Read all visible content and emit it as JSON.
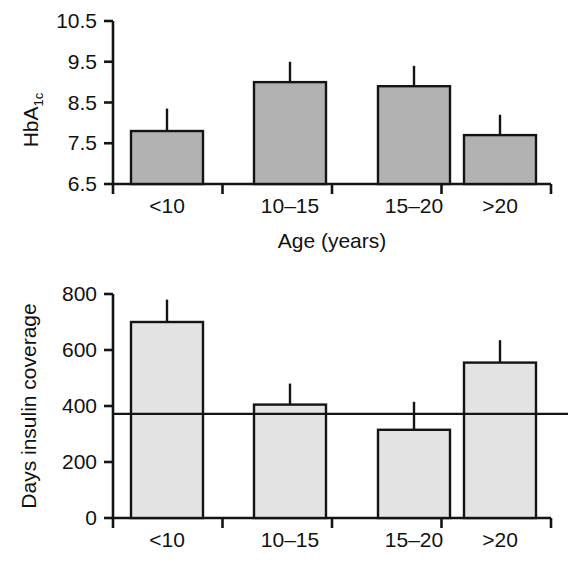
{
  "figure": {
    "name": "hba1c-and-insulin-coverage-by-age",
    "background_color": "#ffffff",
    "axis_color": "#141414"
  },
  "chart_data": [
    {
      "type": "bar",
      "name": "hba1c-by-age",
      "title": "",
      "xlabel": "Age (years)",
      "ylabel": "HbA1c",
      "ylabel_main": "HbA",
      "ylabel_sub": "1c",
      "categories": [
        "<10",
        "10–15",
        "15–20",
        ">20"
      ],
      "values": [
        7.8,
        9.0,
        8.9,
        7.7
      ],
      "errors_upper": [
        8.35,
        9.5,
        9.4,
        8.2
      ],
      "ytick_labels": [
        "6.5",
        "7.5",
        "8.5",
        "9.5",
        "10.5"
      ],
      "yticks": [
        6.5,
        7.5,
        8.5,
        9.5,
        10.5
      ],
      "ylim": [
        6.5,
        10.5
      ],
      "grid": false,
      "legend": "none",
      "bar_fill": "#b2b2b2",
      "bar_edge": "#141414"
    },
    {
      "type": "bar",
      "name": "days-insulin-coverage-by-age",
      "title": "",
      "xlabel": "",
      "ylabel": "Days insulin coverage",
      "categories": [
        "<10",
        "10–15",
        "15–20",
        ">20"
      ],
      "values": [
        700,
        405,
        315,
        555
      ],
      "errors_upper": [
        780,
        480,
        415,
        635
      ],
      "ytick_labels": [
        "0",
        "200",
        "400",
        "600",
        "800"
      ],
      "yticks": [
        0,
        200,
        400,
        600,
        800
      ],
      "ylim": [
        0,
        800
      ],
      "reference_line": 372,
      "grid": false,
      "legend": "none",
      "bar_fill": "#e3e3e3",
      "bar_edge": "#141414"
    }
  ]
}
